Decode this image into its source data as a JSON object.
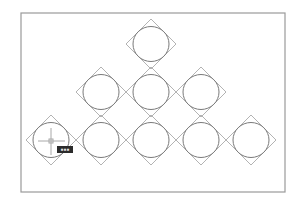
{
  "app": {
    "type": "CAD drawing viewport",
    "colors": {
      "background": "#ffffff",
      "frame": "#9a9a9a",
      "circle": "#7a7a7a",
      "diamond": "#b3b3b3",
      "crosshair": "#a8a8a8",
      "tooltip_bg": "#2b2b2b",
      "tooltip_fg": "#e6e6e6"
    }
  },
  "drawing": {
    "pattern": "pyramid of circles inscribed in diamonds",
    "rows": [
      {
        "row": 1,
        "count": 1
      },
      {
        "row": 2,
        "count": 3
      },
      {
        "row": 3,
        "count": 5
      }
    ],
    "cursor": {
      "type": "crosshair",
      "tooltip_text": "▪▪▪"
    }
  }
}
